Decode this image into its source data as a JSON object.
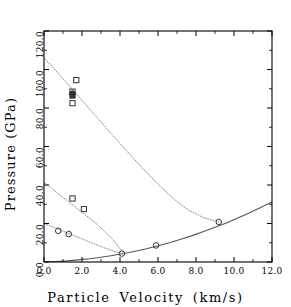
{
  "chart_data": {
    "type": "scatter",
    "title": "",
    "xlabel": "Particle Velocity (km/s)",
    "ylabel": "Pressure (GPa)",
    "xlim": [
      0.0,
      12.0
    ],
    "ylim": [
      0.0,
      120.0
    ],
    "xticks": [
      "0.0",
      "2.0",
      "4.0",
      "6.0",
      "8.0",
      "10.0",
      "12.0"
    ],
    "yticks": [
      "0.0",
      "20.0",
      "40.0",
      "60.0",
      "80.0",
      "100.0",
      "120.0"
    ],
    "xtick_values": [
      0.0,
      2.0,
      4.0,
      6.0,
      8.0,
      10.0,
      12.0
    ],
    "ytick_values": [
      0.0,
      20.0,
      40.0,
      60.0,
      80.0,
      100.0,
      120.0
    ],
    "grid": false,
    "legend": "none",
    "series": [
      {
        "name": "principal Hugoniot (solid)",
        "style": "solid-line",
        "x": [
          0.0,
          0.6,
          1.2,
          1.8,
          2.4,
          3.0,
          3.6,
          4.2,
          4.8,
          5.4,
          6.0,
          6.6,
          7.2,
          7.8,
          8.4,
          9.0,
          9.6,
          10.2,
          10.8,
          11.4,
          12.0
        ],
        "y": [
          0.0,
          0.25,
          0.6,
          1.1,
          1.7,
          2.5,
          3.4,
          4.4,
          5.6,
          6.9,
          8.4,
          10.0,
          11.8,
          13.7,
          15.8,
          18.0,
          20.3,
          22.8,
          25.5,
          28.3,
          31.2
        ]
      },
      {
        "name": "release isentrope A (dotted, high P)",
        "style": "dotted-line",
        "x": [
          -0.4,
          0.4,
          1.2,
          2.0,
          2.8,
          3.6,
          4.4,
          5.2,
          6.0,
          6.8,
          7.6,
          8.4,
          9.2
        ],
        "y": [
          110.5,
          101.8,
          93.0,
          84.0,
          75.0,
          66.0,
          57.2,
          48.6,
          40.4,
          33.0,
          27.0,
          23.0,
          20.8
        ]
      },
      {
        "name": "release isentrope B (dotted, mid P)",
        "style": "dotted-line",
        "x": [
          -0.4,
          0.4,
          1.2,
          2.0,
          2.8,
          3.6,
          4.2
        ],
        "y": [
          44.5,
          38.2,
          32.0,
          25.9,
          19.5,
          12.0,
          4.4
        ]
      },
      {
        "name": "release isentrope C (dotted, low P)",
        "style": "dotted-line",
        "x": [
          -0.4,
          0.3,
          1.0,
          1.7,
          2.4,
          3.1,
          3.8,
          4.2
        ],
        "y": [
          21.5,
          18.8,
          16.0,
          13.2,
          10.4,
          7.6,
          5.2,
          4.4
        ]
      }
    ],
    "points": [
      {
        "x": 1.7,
        "y": 94.5,
        "marker": "square",
        "filled": false
      },
      {
        "x": 1.5,
        "y": 88.5,
        "marker": "square",
        "filled": false
      },
      {
        "x": 1.5,
        "y": 87.5,
        "marker": "circle",
        "filled": true
      },
      {
        "x": 1.5,
        "y": 86.5,
        "marker": "square",
        "filled": true
      },
      {
        "x": 1.5,
        "y": 82.5,
        "marker": "square",
        "filled": false
      },
      {
        "x": 1.5,
        "y": 33.0,
        "marker": "square",
        "filled": false
      },
      {
        "x": 2.1,
        "y": 27.5,
        "marker": "square",
        "filled": false
      },
      {
        "x": 0.75,
        "y": 16.2,
        "marker": "circle",
        "filled": false
      },
      {
        "x": 1.3,
        "y": 14.5,
        "marker": "circle",
        "filled": false
      },
      {
        "x": 4.1,
        "y": 4.4,
        "marker": "circle",
        "filled": false
      },
      {
        "x": 5.9,
        "y": 8.6,
        "marker": "circle",
        "filled": false
      },
      {
        "x": 9.2,
        "y": 20.8,
        "marker": "circle",
        "filled": false
      }
    ]
  },
  "axes": {
    "x_title": "Particle Velocity (km/s)",
    "y_title": "Pressure (GPa)",
    "x_tick_labels": [
      "0.0",
      "2.0",
      "4.0",
      "6.0",
      "8.0",
      "10.0",
      "12.0"
    ],
    "y_tick_labels": [
      "0.0",
      "20.0",
      "40.0",
      "60.0",
      "80.0",
      "100.0",
      "120.0"
    ]
  },
  "colors": {
    "axis": "#000000",
    "curve_solid": "#555555",
    "curve_dotted": "#888888",
    "marker_edge": "#333333",
    "background": "#ffffff"
  }
}
